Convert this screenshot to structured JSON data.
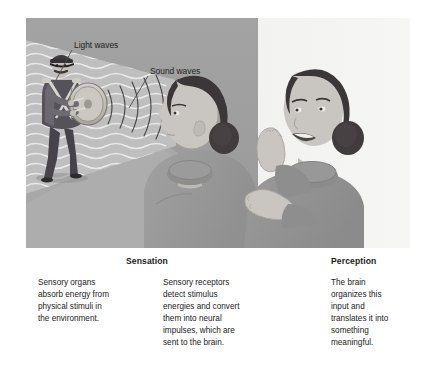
{
  "figure": {
    "name": "sensation-and-perception-diagram",
    "illustration": {
      "labels": [
        {
          "id": "light-waves",
          "text": "Light waves"
        },
        {
          "id": "sound-waves",
          "text": "Sound waves"
        }
      ],
      "scene_elements": [
        {
          "id": "drummer",
          "description": "marching band drummer playing a bass drum"
        },
        {
          "id": "listener",
          "description": "woman in profile facing the drummer"
        },
        {
          "id": "responder",
          "description": "smiling woman clapping her hands"
        },
        {
          "id": "light-cone",
          "description": "wedge of wavy light wave lines"
        },
        {
          "id": "sound-arcs",
          "description": "concentric arcs of sound travelling to the ear"
        }
      ]
    },
    "headings": {
      "sensation": "Sensation",
      "perception": "Perception"
    },
    "columns": [
      {
        "id": "sensation-organs",
        "text": "Sensory organs\nabsorb energy from\nphysical stimuli in\nthe environment."
      },
      {
        "id": "sensation-receptors",
        "text": "Sensory receptors\ndetect stimulus\nenergies and convert\nthem into neural\nimpulses, which are\nsent to the brain."
      },
      {
        "id": "perception-brain",
        "text": "The brain\norganizes this\ninput and\ntranslates it into\nsomething\nmeaningful."
      }
    ],
    "colors": {
      "page_background": "#ffffff",
      "panel_background_left": "#9d9d9d",
      "panel_background_right": "#f2f2f0",
      "light_cone": "#bdbdbd",
      "light_wave_lines": "#ececec",
      "sweater": "#9a9a9a",
      "hair": "#3b3738",
      "skin": "#c9c6c2",
      "uniform": "#4a4749",
      "heading_text": "#1b1b1b",
      "body_text": "#222222",
      "leader_line": "#4d4d4d"
    }
  }
}
